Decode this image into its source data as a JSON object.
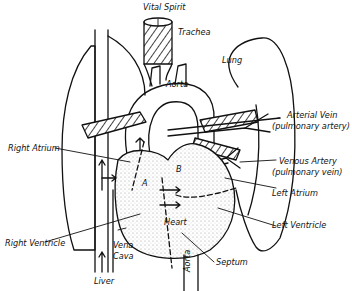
{
  "diagram": {
    "labels": {
      "vital_spirit": "Vital Spirit",
      "trachea": "Trachea",
      "aorta_top": "Aorta",
      "lung": "Lung",
      "arterial_vein": "Arterial Vein",
      "arterial_vein_sub": "(pulmonary artery)",
      "right_atrium": "Right Atrium",
      "venous_artery": "Venous Artery",
      "venous_artery_sub": "(pulmonary vein)",
      "left_atrium": "Left Atrium",
      "left_ventricle": "Left Ventricle",
      "heart": "Heart",
      "point_a": "A",
      "point_b": "B",
      "right_ventricle": "Right Ventricle",
      "vena": "Vena",
      "cava": "Cava",
      "liver": "Liver",
      "septum": "Septum",
      "aorta_bottom": "Aorta"
    },
    "colors": {
      "ink": "#111111",
      "background": "#ffffff",
      "stipple": "#bdbdbd"
    }
  }
}
